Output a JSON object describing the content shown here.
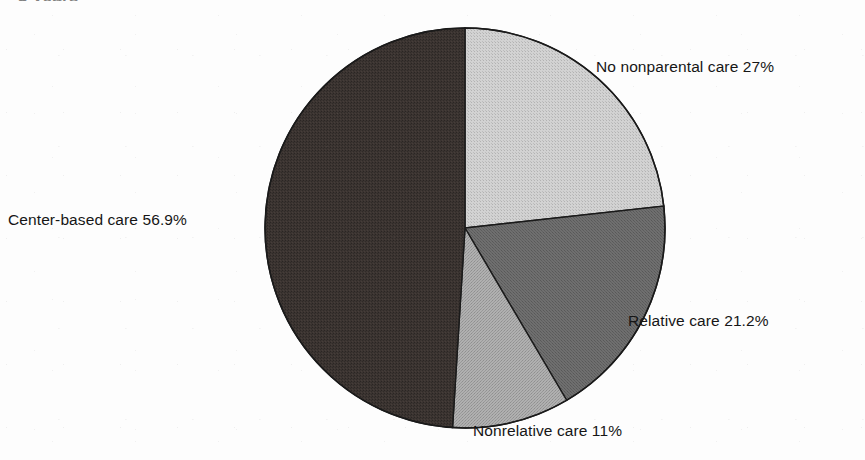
{
  "page": {
    "partial_title_fragment": "3 years",
    "background_color": "#fdfdfd"
  },
  "chart_data": {
    "type": "pie",
    "title": "",
    "xlabel": "",
    "ylabel": "",
    "start_angle_deg": 0,
    "direction": "clockwise",
    "legend_position": "none",
    "labels_position": "outside-callout",
    "grid": false,
    "center_px": {
      "x": 465,
      "y": 228
    },
    "radius_px": 200,
    "categories": [
      "No nonparental care",
      "Relative care",
      "Nonrelative care",
      "Center-based care"
    ],
    "values": [
      27,
      21.2,
      11,
      56.9
    ],
    "value_labels": [
      "27%",
      "21.2%",
      "11%",
      "56.9%"
    ],
    "full_labels": [
      "No nonparental care 27%",
      "Relative care 21.2%",
      "Nonrelative care 11%",
      "Center-based care 56.9%"
    ],
    "colors": [
      "#c9c9c9",
      "#6d6d6d",
      "#a9a9a9",
      "#3b3431"
    ],
    "stroke_color": "#1a1a1a",
    "stroke_width_px": 1.4,
    "total_percent": 116.1
  },
  "labels": {
    "no_nonparental_care": "No nonparental care 27%",
    "center_based_care": "Center-based care 56.9%",
    "relative_care": "Relative care 21.2%",
    "nonrelative_care": "Nonrelative care 11%"
  }
}
